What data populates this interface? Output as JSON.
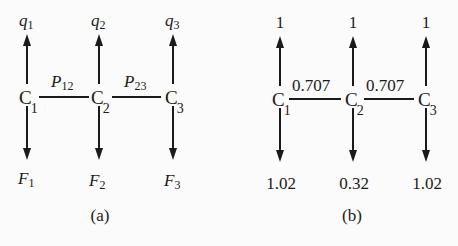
{
  "panels": [
    {
      "id": "a",
      "caption": "(a)",
      "nodes": [
        {
          "label": "C",
          "sub": "1",
          "top": "q",
          "top_sub": "1",
          "bottom": "F",
          "bottom_sub": "1"
        },
        {
          "label": "C",
          "sub": "2",
          "top": "q",
          "top_sub": "2",
          "bottom": "F",
          "bottom_sub": "2"
        },
        {
          "label": "C",
          "sub": "3",
          "top": "q",
          "top_sub": "3",
          "bottom": "F",
          "bottom_sub": "3"
        }
      ],
      "edges": [
        {
          "label": "P",
          "sub": "12"
        },
        {
          "label": "P",
          "sub": "23"
        }
      ]
    },
    {
      "id": "b",
      "caption": "(b)",
      "nodes": [
        {
          "label": "C",
          "sub": "1",
          "top": "1",
          "bottom": "1.02"
        },
        {
          "label": "C",
          "sub": "2",
          "top": "1",
          "bottom": "0.32"
        },
        {
          "label": "C",
          "sub": "3",
          "top": "1",
          "bottom": "1.02"
        }
      ],
      "edges": [
        {
          "label": "0.707"
        },
        {
          "label": "0.707"
        }
      ]
    }
  ]
}
